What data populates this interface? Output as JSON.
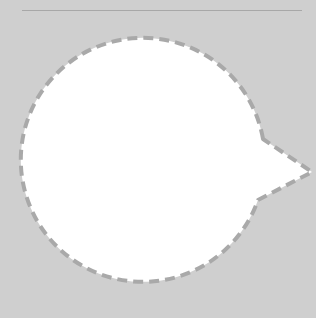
{
  "canvas": {
    "background": "#cfcfcf",
    "rule_color": "#a8a8a8",
    "bubble_fill": "#ffffff",
    "bubble_stroke": "#a9a9a9"
  },
  "shape": {
    "type": "speech-bubble",
    "border_style": "dashed",
    "pointer_direction": "right"
  }
}
